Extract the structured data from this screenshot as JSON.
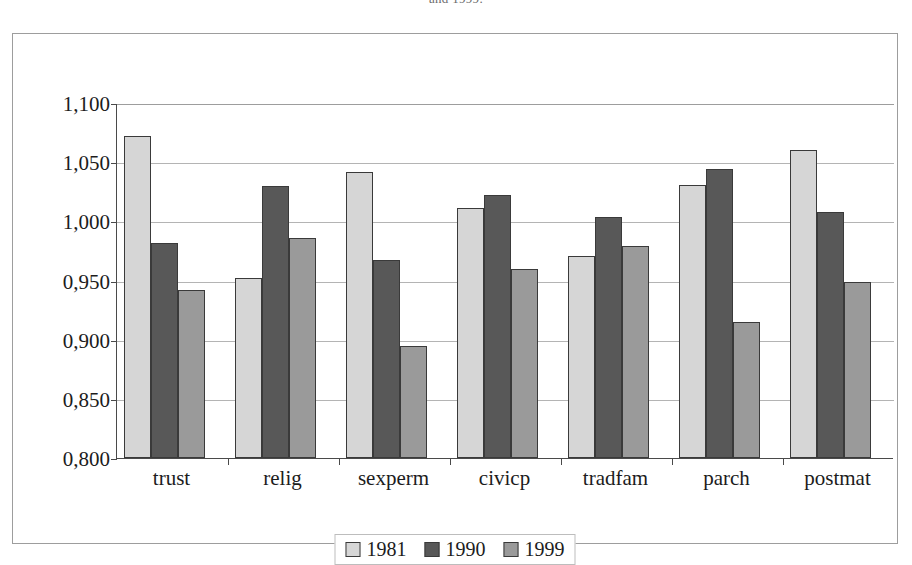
{
  "caption": "and 1999.",
  "chart_data": {
    "type": "bar",
    "title": "",
    "subtitle": "",
    "xlabel": "",
    "ylabel": "",
    "ylim": [
      0.8,
      1.1
    ],
    "ytick_step": 0.05,
    "decimal_separator": ",",
    "grid": true,
    "legend_position": "bottom",
    "categories": [
      "trust",
      "relig",
      "sexperm",
      "civicp",
      "tradfam",
      "parch",
      "postmat"
    ],
    "ytick_labels": [
      "1,100",
      "1,050",
      "1,000",
      "0,950",
      "0,900",
      "0,850",
      "0,800"
    ],
    "ytick_values": [
      1.1,
      1.05,
      1.0,
      0.95,
      0.9,
      0.85,
      0.8
    ],
    "series": [
      {
        "name": "1981",
        "color": "#d6d6d6",
        "values": [
          1.072,
          0.952,
          1.042,
          1.011,
          0.971,
          1.031,
          1.06
        ]
      },
      {
        "name": "1990",
        "color": "#585858",
        "values": [
          0.982,
          1.03,
          0.967,
          1.022,
          1.004,
          1.044,
          1.008
        ]
      },
      {
        "name": "1999",
        "color": "#9a9a9a",
        "values": [
          0.942,
          0.986,
          0.895,
          0.96,
          0.979,
          0.915,
          0.949
        ]
      }
    ]
  }
}
